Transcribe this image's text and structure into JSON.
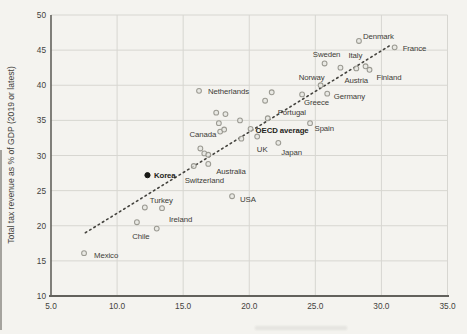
{
  "chart_data": {
    "type": "scatter",
    "title": "",
    "xlabel": "",
    "ylabel": "Total tax revenue as % of GDP (2019 or latest)",
    "xlim": [
      5,
      35
    ],
    "ylim": [
      10,
      50
    ],
    "x_ticks": [
      "5.0",
      "10.0",
      "15.0",
      "20.0",
      "25.0",
      "30.0",
      "35.0"
    ],
    "y_ticks": [
      50,
      45,
      40,
      35,
      30,
      25,
      20,
      15,
      10
    ],
    "grid": true,
    "legend": "none",
    "trend_line": {
      "style": "dotted",
      "x1": 7.6,
      "y1": 19.0,
      "x2": 30.6,
      "y2": 45.6
    },
    "points": [
      {
        "label": "Mexico",
        "x": 7.5,
        "y": 16.1,
        "placement": "right",
        "dx": 10,
        "dy": 5
      },
      {
        "label": "Chile",
        "x": 11.5,
        "y": 20.5,
        "placement": "below",
        "dx": 4,
        "dy": 17
      },
      {
        "label": "Turkey",
        "x": 12.1,
        "y": 22.6,
        "placement": "above-right",
        "dx": 5,
        "dy": -4
      },
      {
        "label": "Ireland",
        "x": 13.4,
        "y": 22.5,
        "placement": "below-right",
        "dx": 7,
        "dy": 14
      },
      {
        "label": "Korea",
        "x": 12.3,
        "y": 27.2,
        "placement": "right",
        "dx": 6.5,
        "dy": 3,
        "bold": true,
        "highlight": true
      },
      {
        "label": "Switzerland",
        "x": 15.8,
        "y": 28.5,
        "placement": "below-right",
        "dx": -9,
        "dy": 17
      },
      {
        "label": "Australia",
        "x": 16.9,
        "y": 28.8,
        "placement": "below-right",
        "dx": 8,
        "dy": 10
      },
      {
        "label": "USA",
        "x": 18.7,
        "y": 24.2,
        "placement": "right",
        "dx": 8,
        "dy": 5.5
      },
      {
        "label": "Canada",
        "x": 18.1,
        "y": 33.7,
        "placement": "left",
        "dx": -8,
        "dy": 7
      },
      {
        "label": "Netherlands",
        "x": 16.2,
        "y": 39.2,
        "placement": "right",
        "dx": 9,
        "dy": 3
      },
      {
        "label": "OECD average",
        "x": 20.1,
        "y": 33.8,
        "placement": "right",
        "dx": 5,
        "dy": 4,
        "bold": true
      },
      {
        "label": "UK",
        "x": 20.6,
        "y": 32.7,
        "placement": "below",
        "dx": 5,
        "dy": 15
      },
      {
        "label": "Japan",
        "x": 22.2,
        "y": 31.8,
        "placement": "below-right",
        "dx": 3,
        "dy": 12
      },
      {
        "label": "Spain",
        "x": 24.6,
        "y": 34.6,
        "placement": "below-right",
        "dx": 4.5,
        "dy": 8
      },
      {
        "label": "Portugal",
        "x": 21.4,
        "y": 35.3,
        "placement": "above-right",
        "dx": 10,
        "dy": -3
      },
      {
        "label": "Greece",
        "x": 24.0,
        "y": 38.7,
        "placement": "below-right",
        "dx": 2,
        "dy": 11
      },
      {
        "label": "Germany",
        "x": 25.9,
        "y": 38.8,
        "placement": "right",
        "dx": 6.5,
        "dy": 5
      },
      {
        "label": "Norway",
        "x": 25.4,
        "y": 40.0,
        "placement": "above-left",
        "dx": 4,
        "dy": -5
      },
      {
        "label": "Sweden",
        "x": 25.7,
        "y": 43.1,
        "placement": "above",
        "dx": 2,
        "dy": -6
      },
      {
        "label": "Austria",
        "x": 26.9,
        "y": 42.5,
        "placement": "below-right",
        "dx": 4,
        "dy": 15
      },
      {
        "label": "Italy",
        "x": 28.1,
        "y": 42.4,
        "placement": "above",
        "dx": -1,
        "dy": -10
      },
      {
        "label": "Finland",
        "x": 29.1,
        "y": 42.2,
        "placement": "below-right",
        "dx": 7,
        "dy": 10
      },
      {
        "label": "Denmark",
        "x": 28.3,
        "y": 46.3,
        "placement": "above-right",
        "dx": 4,
        "dy": -1.5
      },
      {
        "label": "France",
        "x": 31.0,
        "y": 45.4,
        "placement": "right",
        "dx": 8,
        "dy": 4
      }
    ],
    "unlabeled_points": [
      [
        13.0,
        19.6
      ],
      [
        16.3,
        31.0
      ],
      [
        16.6,
        30.3
      ],
      [
        16.9,
        30.1
      ],
      [
        17.5,
        36.1
      ],
      [
        18.2,
        35.9
      ],
      [
        17.7,
        34.6
      ],
      [
        17.8,
        33.4
      ],
      [
        19.3,
        35.0
      ],
      [
        19.4,
        32.4
      ],
      [
        21.2,
        37.8
      ],
      [
        21.7,
        39.0
      ],
      [
        28.8,
        42.7
      ]
    ]
  },
  "colors": {
    "background": "#f4f3ef",
    "gridline": "#d7d6d1",
    "axis": "#62615c",
    "tick_text": "#43423c",
    "label_text": "#3d3c37",
    "marker_stroke": "#9b9a92",
    "marker_fill": "#e6e5e0",
    "highlight_marker": "#181815",
    "trend_line": "#44433e"
  }
}
